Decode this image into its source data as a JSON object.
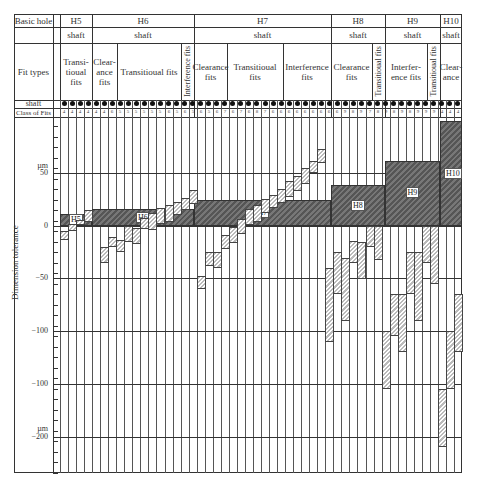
{
  "header": {
    "basic_hole_label": "Basic hole",
    "fit_types_label": "Fit types",
    "shaft_row_label": "shaft",
    "class_row_label": "Class of Fits",
    "holes": [
      {
        "name": "H5",
        "shaft": "shaft",
        "x0": 60,
        "x1": 92
      },
      {
        "name": "H6",
        "shaft": "shaft",
        "x0": 92,
        "x1": 194
      },
      {
        "name": "H7",
        "shaft": "shaft",
        "x0": 194,
        "x1": 331
      },
      {
        "name": "H8",
        "shaft": "shaft",
        "x0": 331,
        "x1": 385
      },
      {
        "name": "H9",
        "shaft": "shaft",
        "x0": 385,
        "x1": 440
      },
      {
        "name": "H10",
        "shaft": "shaft",
        "x0": 440,
        "x1": 462
      }
    ],
    "fit_types": [
      {
        "label": "Transi-\ntioual\nfits",
        "x0": 60,
        "x1": 92,
        "vertical": false
      },
      {
        "label": "Clear-\nance\nfits",
        "x0": 92,
        "x1": 117,
        "vertical": false
      },
      {
        "label": "Transitioual fits",
        "x0": 117,
        "x1": 181,
        "vertical": false
      },
      {
        "label": "Interference fits",
        "x0": 181,
        "x1": 194,
        "vertical": true
      },
      {
        "label": "Clearance\nfits",
        "x0": 194,
        "x1": 227,
        "vertical": false
      },
      {
        "label": "Transitioual\nfits",
        "x0": 227,
        "x1": 283,
        "vertical": false
      },
      {
        "label": "Interference\nfits",
        "x0": 283,
        "x1": 331,
        "vertical": false
      },
      {
        "label": "Clearance\nfits",
        "x0": 331,
        "x1": 372,
        "vertical": false
      },
      {
        "label": "Transitioual fits",
        "x0": 372,
        "x1": 385,
        "vertical": true
      },
      {
        "label": "Interfer-\nence fits",
        "x0": 385,
        "x1": 427,
        "vertical": false
      },
      {
        "label": "Transitioual fits",
        "x0": 427,
        "x1": 440,
        "vertical": true
      },
      {
        "label": "Clear-\nance",
        "x0": 440,
        "x1": 462,
        "vertical": false
      }
    ]
  },
  "axis": {
    "name": "Dimension tolerance",
    "unit": "µm",
    "labels": [
      {
        "text": "µm",
        "y": 166
      },
      {
        "text": "50",
        "y": 173
      },
      {
        "text": "0",
        "y": 226
      },
      {
        "text": "−50",
        "y": 278
      },
      {
        "text": "−100",
        "y": 331
      },
      {
        "text": "−100",
        "y": 384
      },
      {
        "text": "µm",
        "y": 429
      },
      {
        "text": "−200",
        "y": 437
      }
    ]
  },
  "chart_data": {
    "type": "bar",
    "ylabel": "Dimension tolerance (µm)",
    "ytick_labels": [
      "50",
      "0",
      "−50",
      "−100",
      "−100",
      "−200"
    ],
    "zero_line_y_px": 226,
    "px_per_um": 1.05,
    "hole_zones": [
      {
        "name": "H5",
        "upper": 11,
        "lower": 0
      },
      {
        "name": "H6",
        "upper": 16,
        "lower": 0
      },
      {
        "name": "H7",
        "upper": 25,
        "lower": 0
      },
      {
        "name": "H8",
        "upper": 39,
        "lower": 0
      },
      {
        "name": "H9",
        "upper": 62,
        "lower": 0
      },
      {
        "name": "H10",
        "upper": 100,
        "lower": 0
      }
    ],
    "class_of_fits": [
      "4",
      "4",
      "4",
      "4",
      "4",
      "4",
      "6",
      "5",
      "5",
      "5",
      "5",
      "5",
      "5",
      "6",
      "5",
      "6",
      "5",
      "6",
      "5",
      "6",
      "7",
      "6",
      "7",
      "6",
      "8",
      "7",
      "6",
      "6",
      "6",
      "6",
      "6",
      "6",
      "6",
      "6",
      "6",
      "9",
      "8",
      "9",
      "7",
      "8",
      "9",
      "8",
      "9",
      "8",
      "9",
      "9",
      "9"
    ],
    "shaft_zones": [
      {
        "col": 0,
        "upper": -5,
        "lower": -13
      },
      {
        "col": 1,
        "upper": 2,
        "lower": -5
      },
      {
        "col": 2,
        "upper": 6,
        "lower": 1
      },
      {
        "col": 3,
        "upper": 15,
        "lower": 4
      },
      {
        "col": 5,
        "upper": -20,
        "lower": -35
      },
      {
        "col": 6,
        "upper": -10,
        "lower": -20
      },
      {
        "col": 7,
        "upper": -13,
        "lower": -25
      },
      {
        "col": 8,
        "upper": 0,
        "lower": -15
      },
      {
        "col": 9,
        "upper": -2,
        "lower": -17
      },
      {
        "col": 10,
        "upper": 8,
        "lower": -3
      },
      {
        "col": 11,
        "upper": 12,
        "lower": -4
      },
      {
        "col": 12,
        "upper": 17,
        "lower": 2
      },
      {
        "col": 13,
        "upper": 20,
        "lower": 4
      },
      {
        "col": 14,
        "upper": 23,
        "lower": 10
      },
      {
        "col": 15,
        "upper": 27,
        "lower": 15
      },
      {
        "col": 16,
        "upper": 34,
        "lower": 21
      },
      {
        "col": 17,
        "upper": -48,
        "lower": -60
      },
      {
        "col": 18,
        "upper": -25,
        "lower": -38
      },
      {
        "col": 19,
        "upper": -25,
        "lower": -40
      },
      {
        "col": 20,
        "upper": -9,
        "lower": -22
      },
      {
        "col": 21,
        "upper": -1,
        "lower": -16
      },
      {
        "col": 22,
        "upper": 7,
        "lower": -8
      },
      {
        "col": 23,
        "upper": 16,
        "lower": 1
      },
      {
        "col": 24,
        "upper": 20,
        "lower": 4
      },
      {
        "col": 25,
        "upper": 26,
        "lower": 12
      },
      {
        "col": 26,
        "upper": 30,
        "lower": 17
      },
      {
        "col": 27,
        "upper": 35,
        "lower": 22
      },
      {
        "col": 28,
        "upper": 43,
        "lower": 28
      },
      {
        "col": 29,
        "upper": 48,
        "lower": 33
      },
      {
        "col": 30,
        "upper": 55,
        "lower": 40
      },
      {
        "col": 31,
        "upper": 62,
        "lower": 50
      },
      {
        "col": 32,
        "upper": 73,
        "lower": 60
      },
      {
        "col": 33,
        "upper": -40,
        "lower": -110
      },
      {
        "col": 34,
        "upper": -25,
        "lower": -65
      },
      {
        "col": 35,
        "upper": -30,
        "lower": -90
      },
      {
        "col": 36,
        "upper": -14,
        "lower": -35
      },
      {
        "col": 37,
        "upper": -15,
        "lower": -50
      },
      {
        "col": 38,
        "upper": 0,
        "lower": -20
      },
      {
        "col": 39,
        "upper": 0,
        "lower": -32
      },
      {
        "col": 40,
        "upper": -100,
        "lower": -155
      },
      {
        "col": 41,
        "upper": -65,
        "lower": -105
      },
      {
        "col": 42,
        "upper": -65,
        "lower": -120
      },
      {
        "col": 43,
        "upper": -25,
        "lower": -65
      },
      {
        "col": 44,
        "upper": -25,
        "lower": -90
      },
      {
        "col": 45,
        "upper": 0,
        "lower": -35
      },
      {
        "col": 46,
        "upper": 0,
        "lower": -55
      },
      {
        "col": 47,
        "upper": -155,
        "lower": -210
      },
      {
        "col": 48,
        "upper": -100,
        "lower": -155
      },
      {
        "col": 49,
        "upper": -65,
        "lower": -120
      }
    ]
  }
}
